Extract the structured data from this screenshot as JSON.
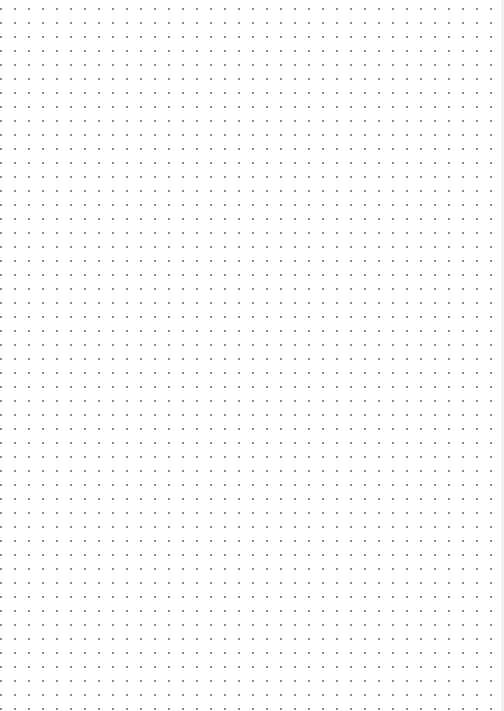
{
  "page": {
    "type": "dot-grid",
    "width": 504,
    "height": 711,
    "background_color": "#ffffff",
    "dot_color": "#8a8a8a",
    "dot_spacing_px": 14,
    "first_dot_x": 15,
    "first_dot_y": 23,
    "columns": 35,
    "rows": 48,
    "edge_color": "#f1f1f1"
  }
}
